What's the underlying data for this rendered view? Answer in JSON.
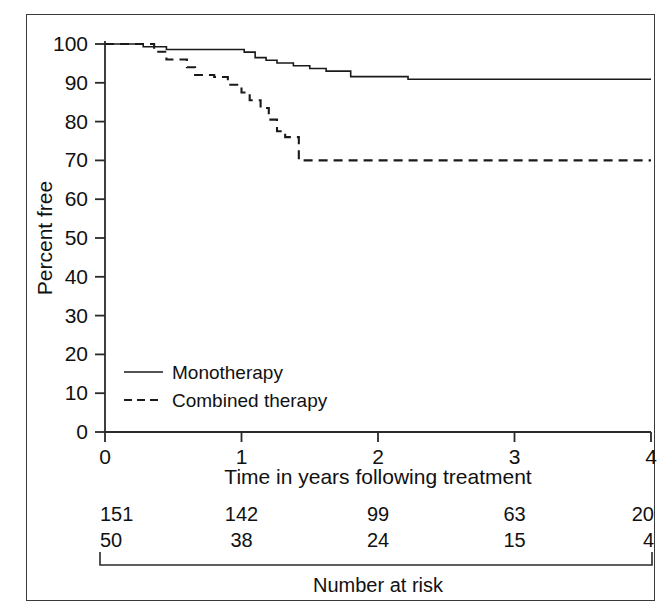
{
  "chart_data": {
    "type": "line",
    "title": "",
    "subtitle": "",
    "xlabel": "Time in years following treatment",
    "ylabel": "Percent free",
    "xlim": [
      0,
      4
    ],
    "ylim": [
      0,
      100
    ],
    "xticks": [
      0,
      1,
      2,
      3,
      4
    ],
    "xticklabels": [
      "0",
      "1",
      "2",
      "3",
      "4"
    ],
    "yticks": [
      0,
      10,
      20,
      30,
      40,
      50,
      60,
      70,
      80,
      90,
      100
    ],
    "yticklabels": [
      "0",
      "10",
      "20",
      "30",
      "40",
      "50",
      "60",
      "70",
      "80",
      "90",
      "100"
    ],
    "grid": false,
    "legend_position": "lower-left-inside",
    "series": [
      {
        "name": "Monotherapy",
        "style": "solid",
        "color": "#1a1a1a",
        "steps": [
          [
            0.0,
            100.0
          ],
          [
            0.28,
            100.0
          ],
          [
            0.28,
            99.3
          ],
          [
            0.45,
            99.3
          ],
          [
            0.45,
            98.6
          ],
          [
            1.02,
            98.6
          ],
          [
            1.02,
            97.9
          ],
          [
            1.1,
            97.9
          ],
          [
            1.1,
            96.5
          ],
          [
            1.18,
            96.5
          ],
          [
            1.18,
            95.8
          ],
          [
            1.26,
            95.8
          ],
          [
            1.26,
            95.1
          ],
          [
            1.38,
            95.1
          ],
          [
            1.38,
            94.4
          ],
          [
            1.5,
            94.4
          ],
          [
            1.5,
            93.7
          ],
          [
            1.62,
            93.7
          ],
          [
            1.62,
            93.0
          ],
          [
            1.8,
            93.0
          ],
          [
            1.8,
            91.6
          ],
          [
            2.22,
            91.6
          ],
          [
            2.22,
            90.9
          ],
          [
            4.0,
            90.9
          ]
        ]
      },
      {
        "name": "Combined therapy",
        "style": "dashed",
        "color": "#1a1a1a",
        "steps": [
          [
            0.0,
            100.0
          ],
          [
            0.36,
            100.0
          ],
          [
            0.36,
            98.0
          ],
          [
            0.45,
            98.0
          ],
          [
            0.45,
            96.0
          ],
          [
            0.6,
            96.0
          ],
          [
            0.6,
            94.0
          ],
          [
            0.66,
            94.0
          ],
          [
            0.66,
            92.0
          ],
          [
            0.8,
            92.0
          ],
          [
            0.8,
            91.5
          ],
          [
            0.9,
            91.5
          ],
          [
            0.9,
            89.5
          ],
          [
            1.0,
            89.5
          ],
          [
            1.0,
            87.5
          ],
          [
            1.06,
            87.5
          ],
          [
            1.06,
            85.5
          ],
          [
            1.14,
            85.5
          ],
          [
            1.14,
            83.5
          ],
          [
            1.2,
            83.5
          ],
          [
            1.2,
            80.5
          ],
          [
            1.26,
            80.5
          ],
          [
            1.26,
            77.5
          ],
          [
            1.32,
            77.5
          ],
          [
            1.32,
            76.0
          ],
          [
            1.42,
            76.0
          ],
          [
            1.42,
            70.0
          ],
          [
            4.0,
            70.0
          ]
        ]
      }
    ],
    "numbers_at_risk": {
      "caption": "Number at risk",
      "times": [
        0,
        1,
        2,
        3,
        4
      ],
      "rows": [
        {
          "series": "Monotherapy",
          "values": [
            "151",
            "142",
            "99",
            "63",
            "20"
          ]
        },
        {
          "series": "Combined therapy",
          "values": [
            "50",
            "38",
            "24",
            "15",
            "4"
          ]
        }
      ]
    },
    "legend": [
      {
        "label": "Monotherapy",
        "style": "solid"
      },
      {
        "label": "Combined therapy",
        "style": "dashed"
      }
    ]
  }
}
